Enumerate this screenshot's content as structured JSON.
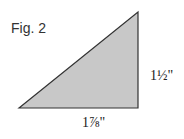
{
  "figure": {
    "label": "Fig. 2",
    "shape": "right-triangle",
    "fill_color": "#c8c8c8",
    "stroke_color": "#333333",
    "vertices": [
      [
        19,
        108
      ],
      [
        138,
        12
      ],
      [
        138,
        108
      ]
    ],
    "dimensions": {
      "height": "1½\"",
      "width": "1⅞\""
    }
  }
}
